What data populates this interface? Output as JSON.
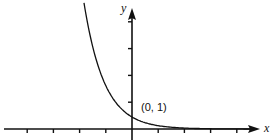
{
  "chart_data": {
    "type": "line",
    "title": "",
    "xlabel": "x",
    "ylabel": "y",
    "annotations": [
      {
        "text": "(0, 1)",
        "x": 0,
        "y": 1
      }
    ],
    "x_ticks_left_of_origin": 4,
    "x_ticks_right_of_origin": 4,
    "y_ticks_above_origin": 4,
    "grid": false,
    "legend": null,
    "series": [
      {
        "name": "exponential decay",
        "points": [
          {
            "x": -1.8,
            "y": 10.5
          },
          {
            "x": -1.5,
            "y": 6.9
          },
          {
            "x": -1.0,
            "y": 3.6
          },
          {
            "x": -0.5,
            "y": 1.9
          },
          {
            "x": 0,
            "y": 1
          },
          {
            "x": 1,
            "y": 0.28
          },
          {
            "x": 2,
            "y": 0.08
          },
          {
            "x": 3,
            "y": 0.02
          },
          {
            "x": 4,
            "y": 0.006
          }
        ]
      }
    ]
  },
  "labels": {
    "x_axis": "x",
    "y_axis": "y",
    "point": "(0, 1)"
  },
  "colors": {
    "stroke": "#111111",
    "background": "#ffffff"
  }
}
